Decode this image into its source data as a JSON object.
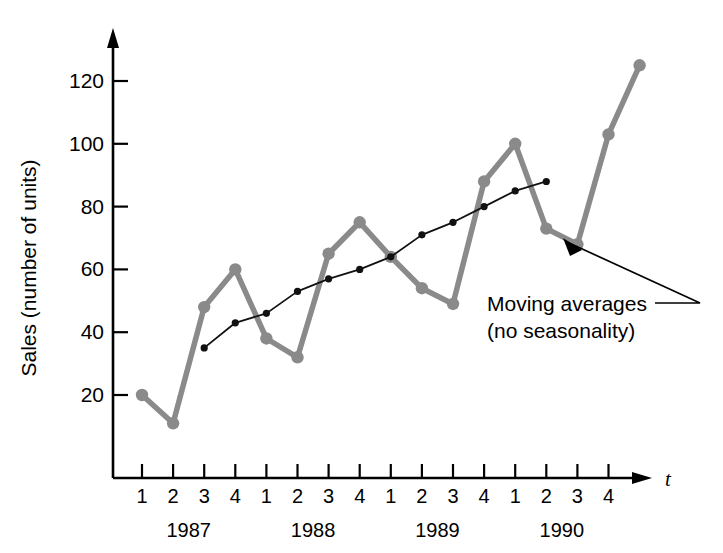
{
  "chart_data": {
    "type": "line",
    "title": "",
    "xlabel": "t",
    "ylabel": "Sales (number of units)",
    "ylim": [
      0,
      133
    ],
    "yticks": [
      20,
      40,
      60,
      80,
      100,
      120
    ],
    "grid": false,
    "legend_position": "annotation",
    "x": [
      1,
      2,
      3,
      4,
      5,
      6,
      7,
      8,
      9,
      10,
      11,
      12,
      13,
      14,
      15,
      16,
      17
    ],
    "quarter_labels": [
      "1",
      "2",
      "3",
      "4",
      "1",
      "2",
      "3",
      "4",
      "1",
      "2",
      "3",
      "4",
      "1",
      "2",
      "3",
      "4"
    ],
    "year_groups": [
      {
        "label": "1987",
        "quarters": [
          "1",
          "2",
          "3",
          "4"
        ]
      },
      {
        "label": "1988",
        "quarters": [
          "1",
          "2",
          "3",
          "4"
        ]
      },
      {
        "label": "1989",
        "quarters": [
          "1",
          "2",
          "3",
          "4"
        ]
      },
      {
        "label": "1990",
        "quarters": [
          "1",
          "2",
          "3",
          "4"
        ]
      }
    ],
    "series": [
      {
        "name": "Sales",
        "color": "#8a8a8a",
        "x": [
          1,
          2,
          3,
          4,
          5,
          6,
          7,
          8,
          9,
          10,
          11,
          12,
          13,
          14,
          15,
          16,
          17
        ],
        "values": [
          20,
          11,
          48,
          60,
          38,
          32,
          65,
          75,
          64,
          54,
          49,
          88,
          100,
          73,
          68,
          103,
          125
        ]
      },
      {
        "name": "Moving averages (no seasonality)",
        "color": "#111111",
        "x": [
          3,
          4,
          5,
          6,
          7,
          8,
          9,
          10,
          11,
          12,
          13,
          14
        ],
        "values": [
          35,
          43,
          46,
          53,
          57,
          60,
          64,
          71,
          75,
          80,
          85,
          88
        ]
      }
    ],
    "annotations": [
      {
        "name": "moving-averages-callout",
        "line1": "Moving averages",
        "line2": "(no seasonality)"
      }
    ]
  },
  "axis": {
    "x_axis_symbol": "t",
    "y_axis_title": "Sales (number of units)"
  }
}
